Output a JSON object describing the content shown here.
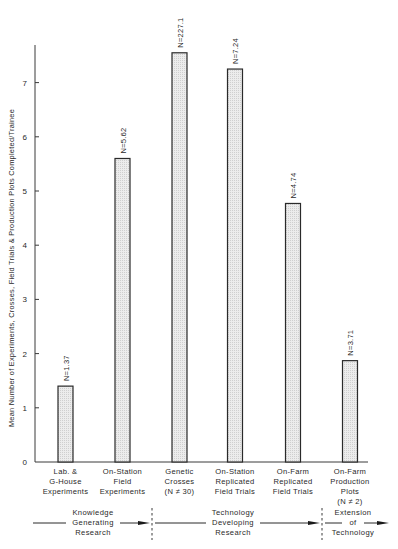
{
  "chart_data": {
    "type": "bar",
    "title": "",
    "xlabel": "",
    "ylabel": "Mean Number of Experiments, Crosses, Field Trials & Production Plots Completed/Trainee",
    "ylim": [
      0,
      7.7
    ],
    "yticks": [
      0,
      1,
      2,
      3,
      4,
      5,
      6,
      7
    ],
    "grid": false,
    "categories": [
      [
        "Lab. &",
        "G-House",
        "Experiments"
      ],
      [
        "On-Station",
        "Field",
        "Experiments"
      ],
      [
        "Genetic",
        "Crosses",
        "(N ≠ 30)"
      ],
      [
        "On-Station",
        "Replicated",
        "Field Trials"
      ],
      [
        "On-Farm",
        "Replicated",
        "Field Trials"
      ],
      [
        "On-Farm",
        "Production",
        "Plots",
        "(N ≠ 2)"
      ]
    ],
    "values": [
      1.4,
      5.6,
      7.55,
      7.25,
      4.77,
      1.87
    ],
    "bar_labels": [
      "N=1.37",
      "N=5.62",
      "N=227.1",
      "N=7.24",
      "N=4.74",
      "N=3.71"
    ],
    "bar_fill": "#e6e6e6",
    "bar_stroke": "#2a2a2a",
    "phases": [
      {
        "label": [
          "Knowledge",
          "Generating",
          "Research"
        ],
        "spans_categories": [
          0,
          1
        ]
      },
      {
        "label": [
          "Technology",
          "Developing",
          "Research"
        ],
        "spans_categories": [
          2,
          3,
          4
        ]
      },
      {
        "label": [
          "Extension",
          "of",
          "Technology"
        ],
        "spans_categories": [
          5
        ]
      }
    ]
  }
}
